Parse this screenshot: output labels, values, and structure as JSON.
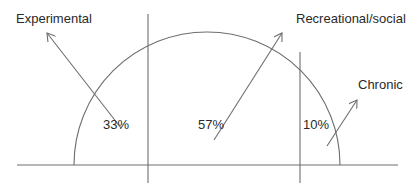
{
  "diagram": {
    "type": "semicircle-partition",
    "segments": [
      {
        "name": "Experimental",
        "percent_label": "33%",
        "value": 33
      },
      {
        "name": "Recreational/social",
        "percent_label": "57%",
        "value": 57
      },
      {
        "name": "Chronic",
        "percent_label": "10%",
        "value": 10
      }
    ],
    "labels": {
      "experimental": "Experimental",
      "recreational": "Recreational/social",
      "chronic": "Chronic",
      "pct_experimental": "33%",
      "pct_recreational": "57%",
      "pct_chronic": "10%"
    },
    "colors": {
      "line": "#6e6e6e",
      "text": "#2a2a2a",
      "background": "#ffffff"
    }
  }
}
